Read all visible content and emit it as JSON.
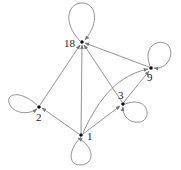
{
  "graph": {
    "title": "",
    "nodes": [
      {
        "id": "18",
        "label": "18",
        "x": 82,
        "y": 42,
        "lx": 64,
        "ly": 47
      },
      {
        "id": "2",
        "label": "2",
        "x": 39,
        "y": 107,
        "lx": 36,
        "ly": 121
      },
      {
        "id": "1",
        "label": "1",
        "x": 81,
        "y": 135,
        "lx": 87,
        "ly": 140
      },
      {
        "id": "3",
        "label": "3",
        "x": 123,
        "y": 104,
        "lx": 118,
        "ly": 99
      },
      {
        "id": "9",
        "label": "9",
        "x": 151,
        "y": 68,
        "lx": 147,
        "ly": 81
      }
    ],
    "edges": [
      {
        "from": "1",
        "to": "18"
      },
      {
        "from": "1",
        "to": "2"
      },
      {
        "from": "1",
        "to": "3"
      },
      {
        "from": "1",
        "to": "9",
        "curved": true
      },
      {
        "from": "2",
        "to": "18"
      },
      {
        "from": "3",
        "to": "18"
      },
      {
        "from": "3",
        "to": "9"
      },
      {
        "from": "9",
        "to": "18"
      }
    ],
    "self_loops": [
      "18",
      "2",
      "1",
      "3",
      "9"
    ],
    "colors": {
      "edge": "#777777",
      "node": "#111111",
      "label": "#222222"
    }
  }
}
